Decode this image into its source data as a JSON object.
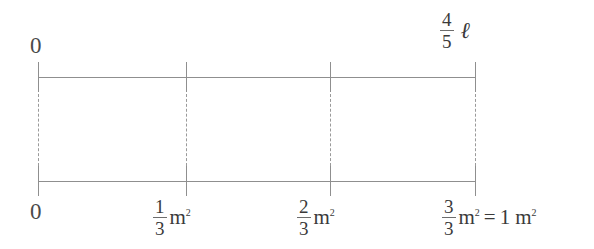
{
  "diagram": {
    "type": "double-number-line",
    "line_color": "#8f8f8f",
    "dash_color": "#9a9a9a",
    "text_color": "#4a4a4a",
    "background": "#ffffff",
    "top_axis": {
      "name": "top-number-line",
      "start_label": "0",
      "end_label": {
        "fraction_numerator": "4",
        "fraction_denominator": "5",
        "symbol": "ℓ"
      },
      "tick_count": 4
    },
    "bottom_axis": {
      "name": "bottom-number-line",
      "start_label": "0",
      "tick_count": 4,
      "labels": [
        {
          "numerator": "1",
          "denominator": "3",
          "unit": "m",
          "exponent": "2"
        },
        {
          "numerator": "2",
          "denominator": "3",
          "unit": "m",
          "exponent": "2"
        },
        {
          "numerator": "3",
          "denominator": "3",
          "unit": "m",
          "exponent": "2",
          "equals": "=",
          "equivalent_value": "1",
          "equivalent_unit": "m",
          "equivalent_exponent": "2"
        }
      ]
    }
  }
}
